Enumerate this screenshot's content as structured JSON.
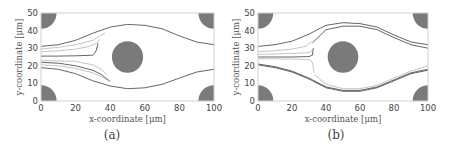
{
  "figure": {
    "panels": [
      {
        "id": "a",
        "caption": "(a)"
      },
      {
        "id": "b",
        "caption": "(b)"
      }
    ]
  },
  "colors": {
    "obstacle": "#7a7a7a",
    "frame": "#cfcfcf",
    "streamline_dark": "#555555",
    "streamline_light": "#aaaaaa"
  },
  "chart_data": [
    {
      "type": "line",
      "title": "(a)",
      "xlabel": "x-coordinate [μm]",
      "ylabel": "y-coordinate [μm]",
      "xlim": [
        0,
        100
      ],
      "ylim": [
        0,
        50
      ],
      "xticks": [
        0,
        20,
        40,
        60,
        80,
        100
      ],
      "yticks": [
        0,
        10,
        20,
        30,
        40,
        50
      ],
      "grid": false,
      "obstacles": [
        {
          "cx": 50,
          "cy": 25,
          "r": 9
        },
        {
          "cx": 0,
          "cy": 50,
          "r": 9
        },
        {
          "cx": 100,
          "cy": 50,
          "r": 9
        },
        {
          "cx": 0,
          "cy": 0,
          "r": 9
        },
        {
          "cx": 100,
          "cy": 0,
          "r": 9
        }
      ],
      "series": [
        {
          "name": "upper boundary",
          "style": "dark",
          "x": [
            0,
            10,
            20,
            30,
            40,
            50,
            60,
            70,
            80,
            90,
            100
          ],
          "y": [
            31,
            32,
            34.5,
            38.5,
            42,
            43.5,
            43,
            41,
            37,
            33.5,
            32
          ]
        },
        {
          "name": "streamline 1",
          "style": "light",
          "x": [
            0,
            10,
            20,
            30,
            34,
            37
          ],
          "y": [
            29.5,
            30.5,
            32,
            34.5,
            37,
            38.5
          ]
        },
        {
          "name": "streamline 2",
          "style": "light",
          "x": [
            0,
            10,
            20,
            28,
            32,
            34
          ],
          "y": [
            28,
            28.5,
            29.5,
            31,
            33,
            35
          ]
        },
        {
          "name": "streamline 3",
          "style": "dark",
          "x": [
            0,
            10,
            20,
            30,
            31,
            32,
            33
          ],
          "y": [
            25.5,
            25.5,
            25.7,
            26,
            27,
            29,
            33
          ]
        },
        {
          "name": "streamline 4",
          "style": "light",
          "x": [
            0,
            10,
            20,
            30,
            35,
            38
          ],
          "y": [
            23,
            22.8,
            22.5,
            20.5,
            18,
            15
          ]
        },
        {
          "name": "streamline 5",
          "style": "dark",
          "x": [
            0,
            10,
            20,
            30,
            35,
            40
          ],
          "y": [
            22,
            21.5,
            20,
            17.5,
            15,
            11
          ]
        },
        {
          "name": "streamline 6",
          "style": "light",
          "x": [
            0,
            10,
            20,
            30,
            35,
            39
          ],
          "y": [
            20.5,
            20,
            18.5,
            16,
            14,
            11.5
          ]
        },
        {
          "name": "lower boundary",
          "style": "dark",
          "x": [
            0,
            10,
            20,
            30,
            40,
            50,
            60,
            70,
            80,
            90,
            100
          ],
          "y": [
            19,
            18,
            15.5,
            11.5,
            8.5,
            7,
            7.5,
            9.5,
            13,
            16.5,
            18
          ]
        }
      ]
    },
    {
      "type": "line",
      "title": "(b)",
      "xlabel": "x-coordinate [μm]",
      "ylabel": "y-coordinate [μm]",
      "xlim": [
        0,
        100
      ],
      "ylim": [
        0,
        50
      ],
      "xticks": [
        0,
        20,
        40,
        60,
        80,
        100
      ],
      "yticks": [
        0,
        10,
        20,
        30,
        40,
        50
      ],
      "grid": false,
      "obstacles": [
        {
          "cx": 50,
          "cy": 25,
          "r": 9
        },
        {
          "cx": 0,
          "cy": 50,
          "r": 9
        },
        {
          "cx": 100,
          "cy": 50,
          "r": 9
        },
        {
          "cx": 0,
          "cy": 0,
          "r": 9
        },
        {
          "cx": 100,
          "cy": 0,
          "r": 9
        }
      ],
      "series": [
        {
          "name": "upper boundary outer",
          "style": "dark",
          "x": [
            0,
            10,
            20,
            30,
            40,
            50,
            60,
            70,
            80,
            90,
            100
          ],
          "y": [
            31,
            32,
            34,
            38,
            43,
            44.5,
            44,
            42,
            37.5,
            33.5,
            32
          ]
        },
        {
          "name": "upper boundary inner",
          "style": "dark",
          "x": [
            32,
            40,
            50,
            60,
            70,
            80,
            90,
            100
          ],
          "y": [
            33,
            40.5,
            42.5,
            42.5,
            40.5,
            36,
            32,
            30
          ]
        },
        {
          "name": "streamline 1",
          "style": "light",
          "x": [
            0,
            10,
            20,
            28,
            32
          ],
          "y": [
            28,
            28.5,
            29.5,
            31,
            34
          ]
        },
        {
          "name": "streamline 2",
          "style": "light",
          "x": [
            0,
            10,
            20,
            30,
            32
          ],
          "y": [
            26.5,
            26.7,
            27,
            27.5,
            29
          ]
        },
        {
          "name": "streamline 3",
          "style": "dark",
          "x": [
            0,
            10,
            20,
            30,
            32,
            32.5
          ],
          "y": [
            25,
            25,
            25,
            25.2,
            26,
            30
          ]
        },
        {
          "name": "streamline 4",
          "style": "light",
          "x": [
            0,
            10,
            20,
            30,
            32,
            33
          ],
          "y": [
            24,
            24,
            23.8,
            23.5,
            22,
            16
          ]
        },
        {
          "name": "lower boundary inner",
          "style": "dark",
          "x": [
            0,
            10,
            20,
            30,
            40,
            50,
            60,
            70,
            80,
            90,
            100
          ],
          "y": [
            21,
            19.5,
            17,
            13,
            8,
            6,
            6,
            8,
            12,
            16,
            18
          ]
        },
        {
          "name": "lower boundary outer",
          "style": "dark",
          "x": [
            0,
            10,
            20,
            30,
            40,
            50,
            60,
            70,
            80,
            90,
            100
          ],
          "y": [
            20.5,
            19,
            16.5,
            12.5,
            7.5,
            5.5,
            5.5,
            7.5,
            11.5,
            15.5,
            17.5
          ]
        },
        {
          "name": "lower boundary mid",
          "style": "light",
          "x": [
            33,
            40,
            50,
            60,
            70,
            80,
            90,
            100
          ],
          "y": [
            15,
            9.5,
            7,
            7,
            9,
            13,
            17,
            20
          ]
        }
      ]
    }
  ]
}
